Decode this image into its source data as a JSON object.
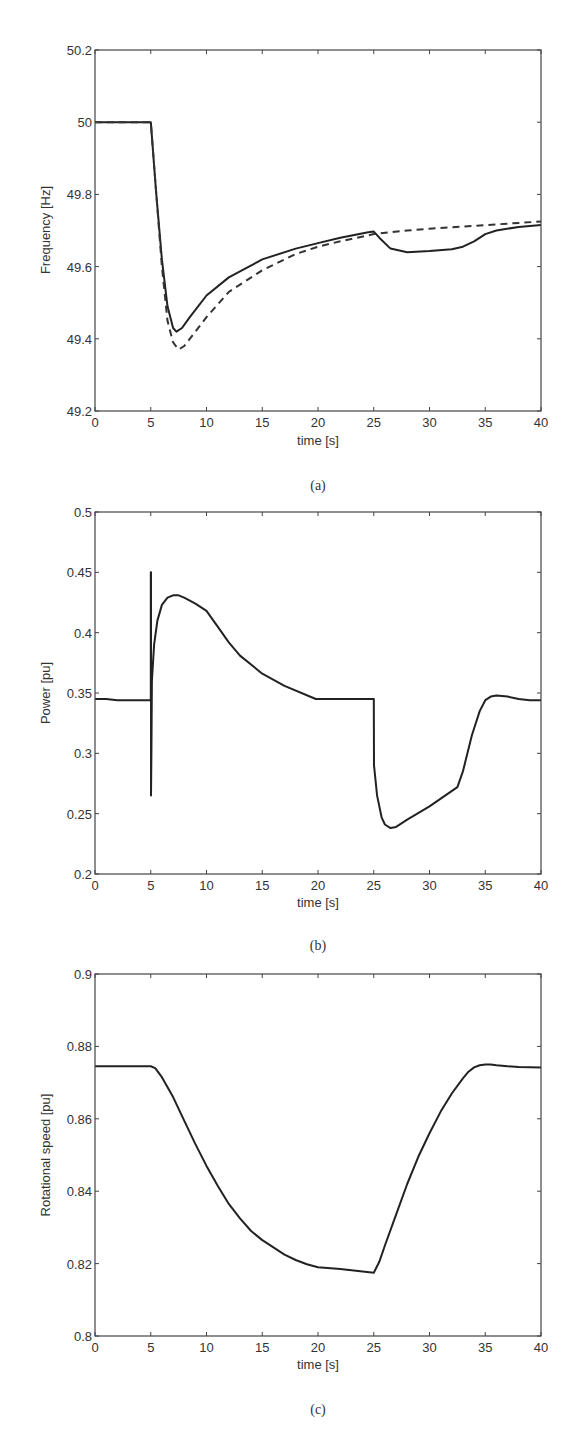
{
  "chart_data": [
    {
      "id": "a",
      "type": "line",
      "caption": "(a)",
      "xlabel": "time [s]",
      "ylabel": "Frequency [Hz]",
      "xlim": [
        0,
        40
      ],
      "ylim": [
        49.2,
        50.2
      ],
      "xticks": [
        0,
        5,
        10,
        15,
        20,
        25,
        30,
        35,
        40
      ],
      "yticks": [
        49.2,
        49.4,
        49.6,
        49.8,
        50,
        50.2
      ],
      "ytick_labels": [
        "49.2",
        "49.4",
        "49.6",
        "49.8",
        "50",
        "50.2"
      ],
      "grid": false,
      "legend": null,
      "series": [
        {
          "name": "solid",
          "style": "solid",
          "x": [
            0,
            5,
            5.1,
            5.5,
            6,
            6.5,
            7,
            7.3,
            7.8,
            8.5,
            10,
            12,
            15,
            18,
            20,
            22,
            24.5,
            25,
            25.5,
            26.5,
            28,
            30,
            32,
            33,
            34,
            35,
            36,
            38,
            40
          ],
          "y": [
            50.0,
            50.0,
            49.96,
            49.8,
            49.62,
            49.49,
            49.43,
            49.42,
            49.43,
            49.46,
            49.52,
            49.57,
            49.62,
            49.65,
            49.665,
            49.68,
            49.695,
            49.697,
            49.68,
            49.65,
            49.64,
            49.643,
            49.648,
            49.655,
            49.67,
            49.69,
            49.7,
            49.71,
            49.715
          ]
        },
        {
          "name": "dashed",
          "style": "dashed",
          "x": [
            0,
            5,
            5.1,
            5.5,
            6,
            6.5,
            7,
            7.5,
            8,
            9,
            10,
            12,
            15,
            18,
            20,
            22,
            25,
            28,
            30,
            35,
            40
          ],
          "y": [
            50.0,
            50.0,
            49.96,
            49.8,
            49.6,
            49.45,
            49.39,
            49.37,
            49.38,
            49.42,
            49.46,
            49.53,
            49.59,
            49.635,
            49.655,
            49.67,
            49.69,
            49.7,
            49.705,
            49.715,
            49.725
          ]
        }
      ]
    },
    {
      "id": "b",
      "type": "line",
      "caption": "(b)",
      "xlabel": "time [s]",
      "ylabel": "Power [pu]",
      "xlim": [
        0,
        40
      ],
      "ylim": [
        0.2,
        0.5
      ],
      "xticks": [
        0,
        5,
        10,
        15,
        20,
        25,
        30,
        35,
        40
      ],
      "yticks": [
        0.2,
        0.25,
        0.3,
        0.35,
        0.4,
        0.45,
        0.5
      ],
      "ytick_labels": [
        "0.2",
        "0.25",
        "0.3",
        "0.35",
        "0.4",
        "0.45",
        "0.5"
      ],
      "grid": false,
      "legend": null,
      "series": [
        {
          "name": "power",
          "style": "solid",
          "x": [
            0,
            1,
            2,
            5,
            5,
            5.02,
            5.02,
            5.06,
            5.1,
            5.3,
            5.6,
            6,
            6.5,
            7,
            7.5,
            8,
            9,
            10,
            11,
            12,
            13,
            15,
            17,
            19.8,
            20,
            25,
            25.02,
            25.3,
            25.7,
            26,
            26.5,
            27,
            28,
            30,
            32.5,
            33,
            33.8,
            34.5,
            35,
            35.5,
            36,
            37,
            38,
            39,
            40
          ],
          "y": [
            0.345,
            0.345,
            0.344,
            0.344,
            0.45,
            0.45,
            0.265,
            0.3,
            0.36,
            0.39,
            0.41,
            0.423,
            0.429,
            0.431,
            0.431,
            0.429,
            0.424,
            0.418,
            0.405,
            0.392,
            0.381,
            0.366,
            0.356,
            0.345,
            0.345,
            0.345,
            0.29,
            0.265,
            0.247,
            0.241,
            0.238,
            0.239,
            0.245,
            0.256,
            0.272,
            0.285,
            0.315,
            0.335,
            0.344,
            0.347,
            0.348,
            0.347,
            0.345,
            0.344,
            0.344
          ]
        }
      ]
    },
    {
      "id": "c",
      "type": "line",
      "caption": "(c)",
      "xlabel": "time [s]",
      "ylabel": "Rotational speed [pu]",
      "xlim": [
        0,
        40
      ],
      "ylim": [
        0.8,
        0.9
      ],
      "xticks": [
        0,
        5,
        10,
        15,
        20,
        25,
        30,
        35,
        40
      ],
      "yticks": [
        0.8,
        0.82,
        0.84,
        0.86,
        0.88,
        0.9
      ],
      "ytick_labels": [
        "0.8",
        "0.82",
        "0.84",
        "0.86",
        "0.88",
        "0.9"
      ],
      "grid": false,
      "legend": null,
      "series": [
        {
          "name": "speed",
          "style": "solid",
          "x": [
            0,
            5,
            5.4,
            6,
            7,
            8,
            9,
            10,
            11,
            12,
            13,
            14,
            15,
            16,
            17,
            18,
            19,
            20,
            22,
            24,
            25,
            25.5,
            26,
            27,
            28,
            29,
            30,
            31,
            32,
            33,
            33.5,
            34,
            34.5,
            35,
            35.5,
            36,
            37,
            38,
            40
          ],
          "y": [
            0.8745,
            0.8745,
            0.874,
            0.8715,
            0.866,
            0.8595,
            0.853,
            0.847,
            0.8415,
            0.8365,
            0.8325,
            0.829,
            0.8265,
            0.8245,
            0.8225,
            0.821,
            0.8198,
            0.819,
            0.8185,
            0.8178,
            0.8175,
            0.8205,
            0.825,
            0.8335,
            0.842,
            0.8495,
            0.856,
            0.862,
            0.867,
            0.8712,
            0.873,
            0.8742,
            0.8748,
            0.875,
            0.875,
            0.8748,
            0.8745,
            0.8743,
            0.8742
          ]
        }
      ]
    }
  ],
  "labels": {
    "a": {
      "caption": "(a)",
      "xlabel": "time [s]",
      "ylabel": "Frequency [Hz]"
    },
    "b": {
      "caption": "(b)",
      "xlabel": "time [s]",
      "ylabel": "Power [pu]"
    },
    "c": {
      "caption": "(c)",
      "xlabel": "time [s]",
      "ylabel": "Rotational speed [pu]"
    }
  }
}
